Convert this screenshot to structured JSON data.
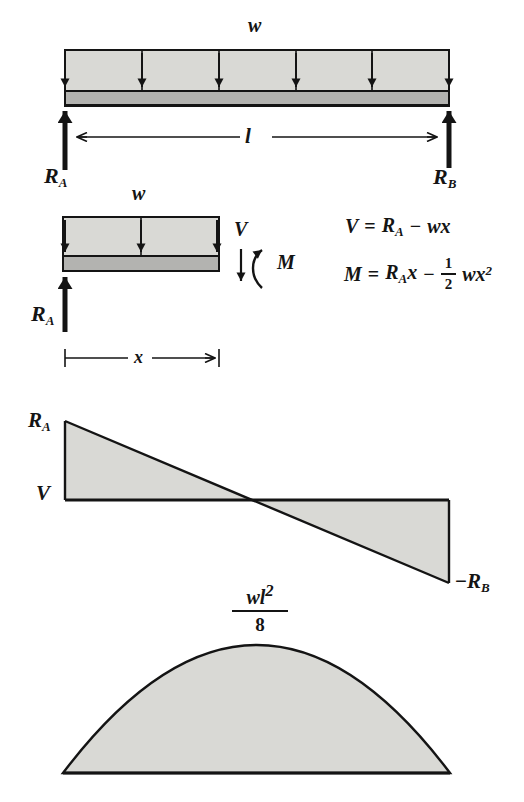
{
  "top_beam": {
    "load_label": "w",
    "length_label": "l",
    "reaction_left": {
      "base": "R",
      "sub": "A"
    },
    "reaction_right": {
      "base": "R",
      "sub": "B"
    }
  },
  "fbd": {
    "load_label": "w",
    "shear_label": "V",
    "moment_label": "M",
    "reaction": {
      "base": "R",
      "sub": "A"
    },
    "distance_label": "x"
  },
  "equations": {
    "shear": {
      "lhs": "V",
      "eq": "=",
      "term1": "R",
      "term1_sub": "A",
      "op": "−",
      "term2": "wx"
    },
    "moment": {
      "lhs": "M",
      "eq": "=",
      "term1": "R",
      "term1_sub": "A",
      "term1_var": "x",
      "op": "−",
      "frac_num": "1",
      "frac_den": "2",
      "term2": "wx",
      "term2_sup": "2"
    }
  },
  "shear_diagram": {
    "top_label": {
      "base": "R",
      "sub": "A"
    },
    "axis_label": "V",
    "bottom_label": {
      "sign": "−",
      "base": "R",
      "sub": "B"
    }
  },
  "moment_diagram": {
    "peak_num": "wl",
    "peak_num_sup": "2",
    "peak_den": "8"
  },
  "colors": {
    "fill_light": "#d9d9d5",
    "fill_mid": "#b3b3b0",
    "ink": "#141414",
    "background": "#ffffff"
  }
}
